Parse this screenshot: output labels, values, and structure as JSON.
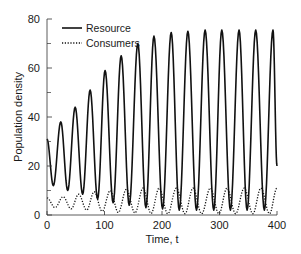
{
  "chart_data": {
    "type": "line",
    "title": "",
    "xlabel": "Time, t",
    "ylabel": "Population density",
    "xlim": [
      0,
      400
    ],
    "ylim": [
      0,
      80
    ],
    "xticks": [
      0,
      100,
      200,
      300,
      400
    ],
    "yticks": [
      0,
      20,
      40,
      60,
      80
    ],
    "yminor_ticks": [
      10,
      30,
      50,
      70
    ],
    "grid": false,
    "legend_position": "upper left",
    "series": [
      {
        "name": "Resource",
        "style": "solid",
        "color": "#111111",
        "start_value": 31,
        "peaks_t": [
          24,
          49,
          75,
          101,
          129,
          158,
          186,
          216,
          245,
          275,
          304,
          334,
          363,
          393
        ],
        "peaks_value": [
          38,
          44,
          51,
          59,
          65,
          70,
          73,
          74.5,
          75,
          75.5,
          75.5,
          75.5,
          75.5,
          75.5
        ],
        "troughs_t": [
          11,
          36,
          62,
          88,
          115,
          143,
          172,
          201,
          230,
          260,
          290,
          319,
          348,
          378
        ],
        "troughs_value": [
          12,
          10,
          8.5,
          6.5,
          5,
          4,
          3,
          2.5,
          2,
          2,
          2,
          2,
          2,
          2
        ],
        "end_value": 20
      },
      {
        "name": "Consumers",
        "style": "dotted",
        "color": "#111111",
        "start_value": 7,
        "peaks_t": [
          28,
          55,
          82,
          110,
          138,
          167,
          195,
          225,
          254,
          284,
          313,
          343,
          372,
          400
        ],
        "peaks_value": [
          7.5,
          8.5,
          9.5,
          10,
          10.5,
          11,
          11,
          11,
          11,
          11,
          11,
          11,
          11,
          11
        ],
        "troughs_t": [
          14,
          42,
          69,
          96,
          124,
          153,
          181,
          210,
          240,
          269,
          299,
          328,
          358,
          387
        ],
        "troughs_value": [
          3,
          2.5,
          2,
          1.5,
          1,
          0.8,
          0.6,
          0.5,
          0.5,
          0.5,
          0.5,
          0.5,
          0.5,
          0.5
        ],
        "end_value": 11
      }
    ]
  }
}
